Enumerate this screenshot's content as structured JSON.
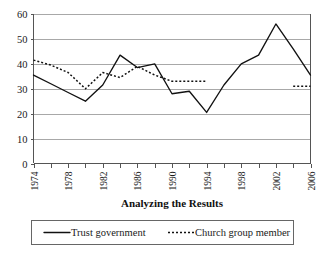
{
  "chart_data": {
    "type": "line",
    "title": "",
    "xlabel": "Analyzing the Results",
    "ylabel": "",
    "ylim": [
      0,
      60
    ],
    "ytick_values": [
      0,
      10,
      20,
      30,
      40,
      50,
      60
    ],
    "ytick_labels": [
      "0",
      "10",
      "20",
      "30",
      "40",
      "50",
      "60"
    ],
    "grid": true,
    "legend_position": "bottom",
    "x": [
      1974,
      1976,
      1978,
      1980,
      1982,
      1984,
      1986,
      1988,
      1990,
      1992,
      1994,
      1996,
      1998,
      2000,
      2002,
      2004,
      2006
    ],
    "xtick_labels": [
      "1974",
      "",
      "1978",
      "",
      "1982",
      "",
      "1986",
      "",
      "1990",
      "",
      "1994",
      "",
      "1998",
      "",
      "2002",
      "",
      "2006"
    ],
    "xtick_labels_shown": [
      "1974",
      "1978",
      "1982",
      "1986",
      "1990",
      "1994",
      "1998",
      "2002",
      "2006"
    ],
    "series": [
      {
        "name": "Trust government",
        "style": "solid",
        "color": "#111111",
        "values": [
          35.5,
          32.0,
          28.5,
          25.0,
          31.5,
          43.5,
          38.5,
          40.0,
          28.0,
          29.0,
          20.5,
          31.5,
          40.0,
          43.5,
          56.0,
          46.0,
          35.5
        ]
      },
      {
        "name": "Church group member",
        "style": "dotted",
        "color": "#111111",
        "values": [
          41.5,
          39.5,
          36.5,
          30.0,
          36.5,
          34.5,
          39.0,
          35.5,
          33.0,
          33.0,
          33.0,
          null,
          null,
          null,
          null,
          31.0,
          31.0
        ]
      }
    ]
  },
  "legend": {
    "items": [
      {
        "label": "Trust government",
        "style": "solid"
      },
      {
        "label": "Church group member",
        "style": "dotted"
      }
    ]
  }
}
